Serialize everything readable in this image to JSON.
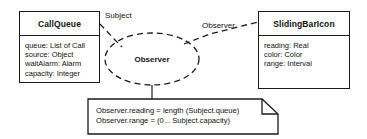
{
  "diagram": {
    "type": "uml-collaboration-diagram",
    "stroke_color": "#1a1a1a",
    "background_color": "#ffffff"
  },
  "classes": [
    {
      "name": "CallQueue",
      "attributes": [
        "queue: List of Call",
        "source: Object",
        "waitAlarm: Alarm",
        "capacity: Integer"
      ]
    },
    {
      "name": "SlidingBarIcon",
      "attributes": [
        "reading: Real",
        "color: Color",
        "range: Interval"
      ]
    }
  ],
  "collaboration": {
    "name": "Observer"
  },
  "roles": [
    {
      "label": "Subject"
    },
    {
      "label": "Observer"
    }
  ],
  "note": {
    "lines": [
      "Observer.reading = length (Subject.queue)",
      "Observer.range = (0 .. Subject.capacity)"
    ]
  }
}
